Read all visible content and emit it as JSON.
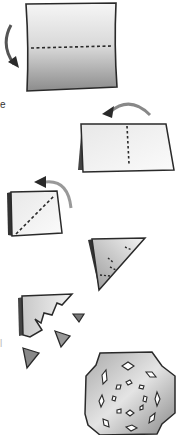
{
  "figure": {
    "type": "instructional-diagram",
    "steps": [
      {
        "index": 1,
        "description": "Square sheet with horizontal dashed fold line; arrow curving down",
        "shape": "square"
      },
      {
        "index": 2,
        "description": "Folded rectangle with vertical dashed fold line; arrow curving left",
        "shape": "rectangle"
      },
      {
        "index": 3,
        "description": "Folded square with diagonal dashed fold line; arrow curving up-left",
        "shape": "small-square"
      },
      {
        "index": 4,
        "description": "Folded triangle with dashed cut lines",
        "shape": "triangle"
      },
      {
        "index": 5,
        "description": "Cut triangle with removed pieces",
        "shape": "cut-triangle"
      },
      {
        "index": 6,
        "description": "Unfolded snowflake with diamond cutouts",
        "shape": "snowflake"
      }
    ],
    "edge_text_fragments": [
      "e",
      "l"
    ],
    "colors": {
      "outline": "#2a2a2a",
      "paper_light": "#f4f4f4",
      "paper_dark": "#8a8a8a",
      "arrow": "#3a3a3a"
    }
  }
}
